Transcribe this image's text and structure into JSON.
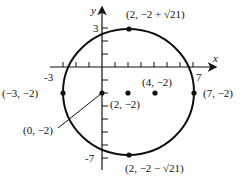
{
  "diagram": {
    "type": "circle-on-coordinate-plane",
    "equation_center": [
      2,
      -2
    ],
    "radius": 5,
    "axes": {
      "x_label": "x",
      "y_label": "y",
      "x_tick_labels": [
        "-3",
        "7"
      ],
      "y_tick_labels": [
        "3",
        "-7"
      ]
    },
    "points": [
      {
        "id": "top",
        "label": "(2, −2 + √21)"
      },
      {
        "id": "bottom",
        "label": "(2, −2 − √21)"
      },
      {
        "id": "left",
        "label": "(−3, −2)"
      },
      {
        "id": "right",
        "label": "(7, −2)"
      },
      {
        "id": "center",
        "label": "(2, −2)"
      },
      {
        "id": "focus",
        "label": "(4, −2)"
      },
      {
        "id": "yint",
        "label": "(0, −2)"
      }
    ],
    "colors": {
      "stroke": "#111111",
      "background": "#ffffff"
    }
  }
}
